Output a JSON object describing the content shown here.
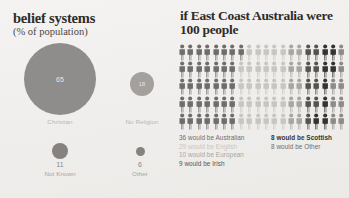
{
  "left": {
    "title": "belief systems",
    "subtitle": "(% of population)",
    "bubbles": [
      {
        "id": "christian",
        "value": "65",
        "label": "Christian",
        "color": "#8f8d8b"
      },
      {
        "id": "noreligion",
        "value": "18",
        "label": "No Religion",
        "color": "#a3a09d"
      },
      {
        "id": "notknown",
        "value": "11",
        "label": "Not Known",
        "color": "#858280"
      },
      {
        "id": "other",
        "value": "6",
        "label": "Other",
        "color": "#858280"
      }
    ]
  },
  "right": {
    "title": "if East Coast Australia were 100 people",
    "total_people": 100,
    "legend_left": [
      {
        "text": "36 would be Australian",
        "color": "#6f6c6a",
        "emphasis": "normal"
      },
      {
        "text": "29 would be English",
        "color": "#c9c6c2",
        "emphasis": "normal"
      },
      {
        "text": "10 would be European",
        "color": "#a9a6a2",
        "emphasis": "normal"
      },
      {
        "text": "9 would be Irish",
        "color": "#56534f",
        "emphasis": "normal"
      }
    ],
    "legend_right": [
      {
        "text": "8 would be Scottish",
        "color": "#35322f",
        "emphasis": "bold"
      },
      {
        "text": "8 would be Other",
        "color": "#6f6c6a",
        "emphasis": "normal"
      }
    ]
  },
  "chart_data": {
    "type": "pie",
    "title": "belief systems (% of population)",
    "categories": [
      "Christian",
      "No Religion",
      "Not Known",
      "Other"
    ],
    "values": [
      65,
      18,
      11,
      6
    ],
    "unit": "% of population",
    "companion": {
      "type": "pictogram",
      "title": "if East Coast Australia were 100 people",
      "total": 100,
      "categories": [
        "Australian",
        "English",
        "European",
        "Irish",
        "Scottish",
        "Other"
      ],
      "values": [
        36,
        29,
        10,
        9,
        8,
        8
      ],
      "colors": [
        "#6f6c6a",
        "#c9c6c2",
        "#a9a6a2",
        "#56534f",
        "#35322f",
        "#8d8a87"
      ],
      "grid": {
        "columns": 20,
        "rows": 5
      }
    }
  }
}
